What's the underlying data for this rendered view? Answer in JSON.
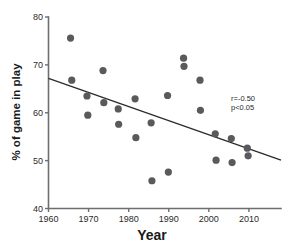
{
  "chart_data": {
    "type": "scatter",
    "title": "",
    "xlabel": "Year",
    "ylabel": "% of game in play",
    "xlim": [
      1960,
      2018
    ],
    "ylim": [
      40,
      80
    ],
    "xticks": [
      1960,
      1970,
      1980,
      1990,
      2000,
      2010
    ],
    "yticks": [
      40,
      50,
      60,
      70,
      80
    ],
    "grid": false,
    "legend": "none",
    "points": [
      {
        "x": 1965.5,
        "y": 75.6
      },
      {
        "x": 1965.8,
        "y": 66.8
      },
      {
        "x": 1969.6,
        "y": 63.5
      },
      {
        "x": 1969.8,
        "y": 59.5
      },
      {
        "x": 1973.6,
        "y": 68.8
      },
      {
        "x": 1973.8,
        "y": 62.1
      },
      {
        "x": 1977.4,
        "y": 60.8
      },
      {
        "x": 1977.5,
        "y": 57.6
      },
      {
        "x": 1981.6,
        "y": 62.9
      },
      {
        "x": 1981.8,
        "y": 54.8
      },
      {
        "x": 1985.6,
        "y": 57.9
      },
      {
        "x": 1985.8,
        "y": 45.8
      },
      {
        "x": 1989.7,
        "y": 63.6
      },
      {
        "x": 1989.9,
        "y": 47.6
      },
      {
        "x": 1993.7,
        "y": 71.4
      },
      {
        "x": 1993.8,
        "y": 69.7
      },
      {
        "x": 1997.8,
        "y": 66.8
      },
      {
        "x": 1997.9,
        "y": 60.5
      },
      {
        "x": 2001.6,
        "y": 55.6
      },
      {
        "x": 2001.8,
        "y": 50.1
      },
      {
        "x": 2005.6,
        "y": 54.6
      },
      {
        "x": 2005.8,
        "y": 49.6
      },
      {
        "x": 2009.6,
        "y": 52.6
      },
      {
        "x": 2009.8,
        "y": 51.0
      }
    ],
    "fit_line": {
      "x1": 1960,
      "y1": 67.2,
      "x2": 2018,
      "y2": 50.1
    },
    "annotations": {
      "correlation": "r=-0.50",
      "pvalue": "p<0.05"
    },
    "marker_color": "#59595e",
    "line_color": "#2b2b2b",
    "axis_color": "#6e6e6e"
  }
}
